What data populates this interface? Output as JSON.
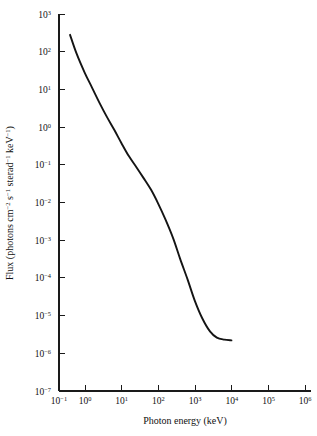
{
  "chart_data": {
    "type": "line",
    "title": "",
    "xlabel": "Photon energy (keV)",
    "ylabel": "Flux (photons cm−2 s−1 sterad−1 keV−1)",
    "xscale": "log",
    "yscale": "log",
    "xlim": [
      0.1,
      1000000
    ],
    "ylim": [
      1e-07,
      1000
    ],
    "grid": false,
    "legend": null,
    "xticks": [
      0.1,
      1,
      10,
      100,
      1000,
      10000,
      100000,
      1000000
    ],
    "xtick_labels": [
      "10−1",
      "10⁰",
      "10¹",
      "10²",
      "10³",
      "10⁴",
      "10⁵",
      "10⁶"
    ],
    "yticks": [
      1e-07,
      1e-06,
      1e-05,
      0.0001,
      0.001,
      0.01,
      0.1,
      1,
      10,
      100,
      1000
    ],
    "ytick_labels": [
      "10−7",
      "10−6",
      "10−5",
      "10−4",
      "10−3",
      "10−2",
      "10−1",
      "10⁰",
      "10¹",
      "10²",
      "10³"
    ],
    "series": [
      {
        "name": "Diffuse cosmic X-ray / gamma-ray background",
        "color": "#141414",
        "x": [
          0.2,
          0.3,
          0.5,
          0.8,
          1.3,
          2.0,
          3.2,
          5.0,
          8.0,
          13.0,
          20.0,
          32.0,
          50.0,
          80.0,
          130.0,
          200.0,
          320.0,
          500.0,
          800.0,
          1300.0,
          2000.0,
          3200.0,
          5000.0
        ],
        "y": [
          280.0,
          90.0,
          28.0,
          11.0,
          4.2,
          1.9,
          0.85,
          0.38,
          0.17,
          0.085,
          0.045,
          0.022,
          0.0095,
          0.0035,
          0.0011,
          0.00032,
          9e-05,
          2.5e-05,
          8.5e-06,
          3.8e-06,
          2.6e-06,
          2.3e-06,
          2.2e-06
        ]
      }
    ],
    "series_pixel_path": [
      [
        62,
        32
      ],
      [
        68,
        51
      ],
      [
        75,
        67
      ],
      [
        82,
        80
      ],
      [
        90,
        94
      ],
      [
        99,
        108
      ],
      [
        108,
        121
      ],
      [
        118,
        135
      ],
      [
        129,
        150
      ],
      [
        140,
        165
      ],
      [
        152,
        182
      ],
      [
        163,
        199
      ],
      [
        174,
        219
      ],
      [
        184,
        240
      ],
      [
        194,
        262
      ],
      [
        202,
        284
      ],
      [
        209,
        304
      ],
      [
        214,
        321
      ],
      [
        218,
        334
      ],
      [
        220,
        343
      ],
      [
        222,
        348
      ],
      [
        222,
        350
      ]
    ],
    "colors": {
      "curve": "#141414",
      "axis": "#1a1a1a",
      "background": "#ffffff",
      "text": "#111111"
    }
  },
  "axes": {
    "x_title": "Photon energy (keV)",
    "y_title_parts": {
      "prefix": "Flux (photons cm",
      "exp1": "−2",
      "mid1": " s",
      "exp2": "−1",
      "mid2": " sterad",
      "exp3": "−1",
      "mid3": " keV",
      "exp4": "−1",
      "suffix": ")"
    },
    "x_tick_mantissa": "10",
    "x_tick_exponents": [
      "−1",
      "0",
      "1",
      "2",
      "3",
      "4",
      "5",
      "6"
    ],
    "y_tick_mantissa": "10",
    "y_tick_exponents": [
      "3",
      "2",
      "1",
      "0",
      "−1",
      "−2",
      "−3",
      "−4",
      "−5",
      "−6",
      "−7"
    ]
  }
}
